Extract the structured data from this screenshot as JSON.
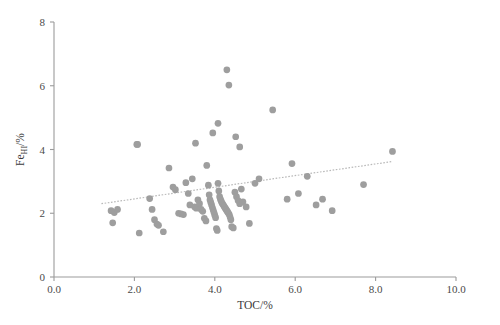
{
  "chart_data": {
    "type": "scatter",
    "title": "",
    "xlabel": "TOC/%",
    "ylabel": "Fe_HI/%",
    "ylabel_base": "Fe",
    "ylabel_sub": "HI",
    "ylabel_unit": "/%",
    "xlim": [
      0.0,
      10.0
    ],
    "ylim": [
      0,
      8
    ],
    "xticks": [
      "0.0",
      "2.0",
      "4.0",
      "6.0",
      "8.0",
      "10.0"
    ],
    "xtick_values": [
      0.0,
      2.0,
      4.0,
      6.0,
      8.0,
      10.0
    ],
    "yticks": [
      "0",
      "2",
      "4",
      "6",
      "8"
    ],
    "ytick_values": [
      0,
      2,
      4,
      6,
      8
    ],
    "grid": false,
    "legend": "none",
    "marker_color": "#9e9e9e",
    "marker_size": 5.2,
    "trendline": {
      "style": "dotted",
      "color": "#b9b9b9",
      "x_start": 1.18,
      "y_start": 2.3,
      "x_end": 8.4,
      "y_end": 3.62
    },
    "x": [
      1.42,
      1.5,
      1.46,
      1.58,
      2.08,
      2.12,
      2.38,
      2.44,
      2.5,
      2.56,
      2.6,
      2.72,
      2.86,
      2.96,
      3.02,
      3.1,
      3.16,
      3.22,
      3.28,
      3.34,
      3.38,
      3.44,
      3.5,
      3.54,
      3.58,
      3.62,
      3.66,
      3.7,
      3.74,
      3.78,
      3.8,
      3.84,
      3.86,
      3.88,
      3.9,
      3.92,
      3.94,
      3.96,
      3.98,
      4.0,
      4.02,
      4.04,
      4.06,
      4.08,
      4.1,
      4.12,
      4.14,
      4.16,
      4.18,
      4.2,
      4.22,
      4.24,
      4.26,
      4.28,
      4.3,
      4.32,
      4.34,
      4.36,
      4.38,
      4.4,
      4.42,
      4.46,
      4.5,
      4.54,
      4.58,
      4.62,
      4.66,
      4.7,
      4.78,
      4.86,
      5.0,
      5.1,
      5.44,
      5.8,
      5.92,
      6.08,
      6.3,
      6.52,
      6.68,
      6.92,
      7.7,
      8.42,
      4.3,
      4.35,
      3.95,
      4.08,
      3.52,
      2.06,
      4.52,
      4.62
    ],
    "y": [
      2.08,
      2.02,
      1.7,
      2.12,
      4.16,
      1.38,
      2.46,
      2.12,
      1.8,
      1.66,
      1.62,
      1.42,
      3.42,
      2.82,
      2.74,
      2.0,
      1.98,
      1.96,
      2.96,
      2.62,
      2.26,
      3.08,
      2.2,
      2.16,
      2.42,
      2.3,
      2.12,
      2.06,
      1.84,
      1.76,
      3.5,
      2.88,
      2.58,
      2.42,
      2.34,
      2.26,
      2.18,
      2.1,
      2.02,
      1.94,
      1.86,
      1.52,
      1.46,
      2.94,
      2.7,
      2.52,
      2.44,
      2.38,
      2.32,
      2.28,
      2.24,
      2.2,
      2.16,
      2.12,
      2.08,
      2.04,
      2.0,
      1.96,
      1.88,
      1.8,
      1.58,
      1.54,
      2.66,
      2.52,
      2.4,
      2.3,
      2.76,
      2.36,
      2.2,
      1.68,
      2.94,
      3.08,
      5.24,
      2.44,
      3.56,
      2.62,
      3.16,
      2.26,
      2.44,
      2.08,
      2.9,
      3.94,
      6.5,
      6.02,
      4.52,
      4.82,
      4.2,
      4.16,
      4.4,
      4.08
    ]
  }
}
